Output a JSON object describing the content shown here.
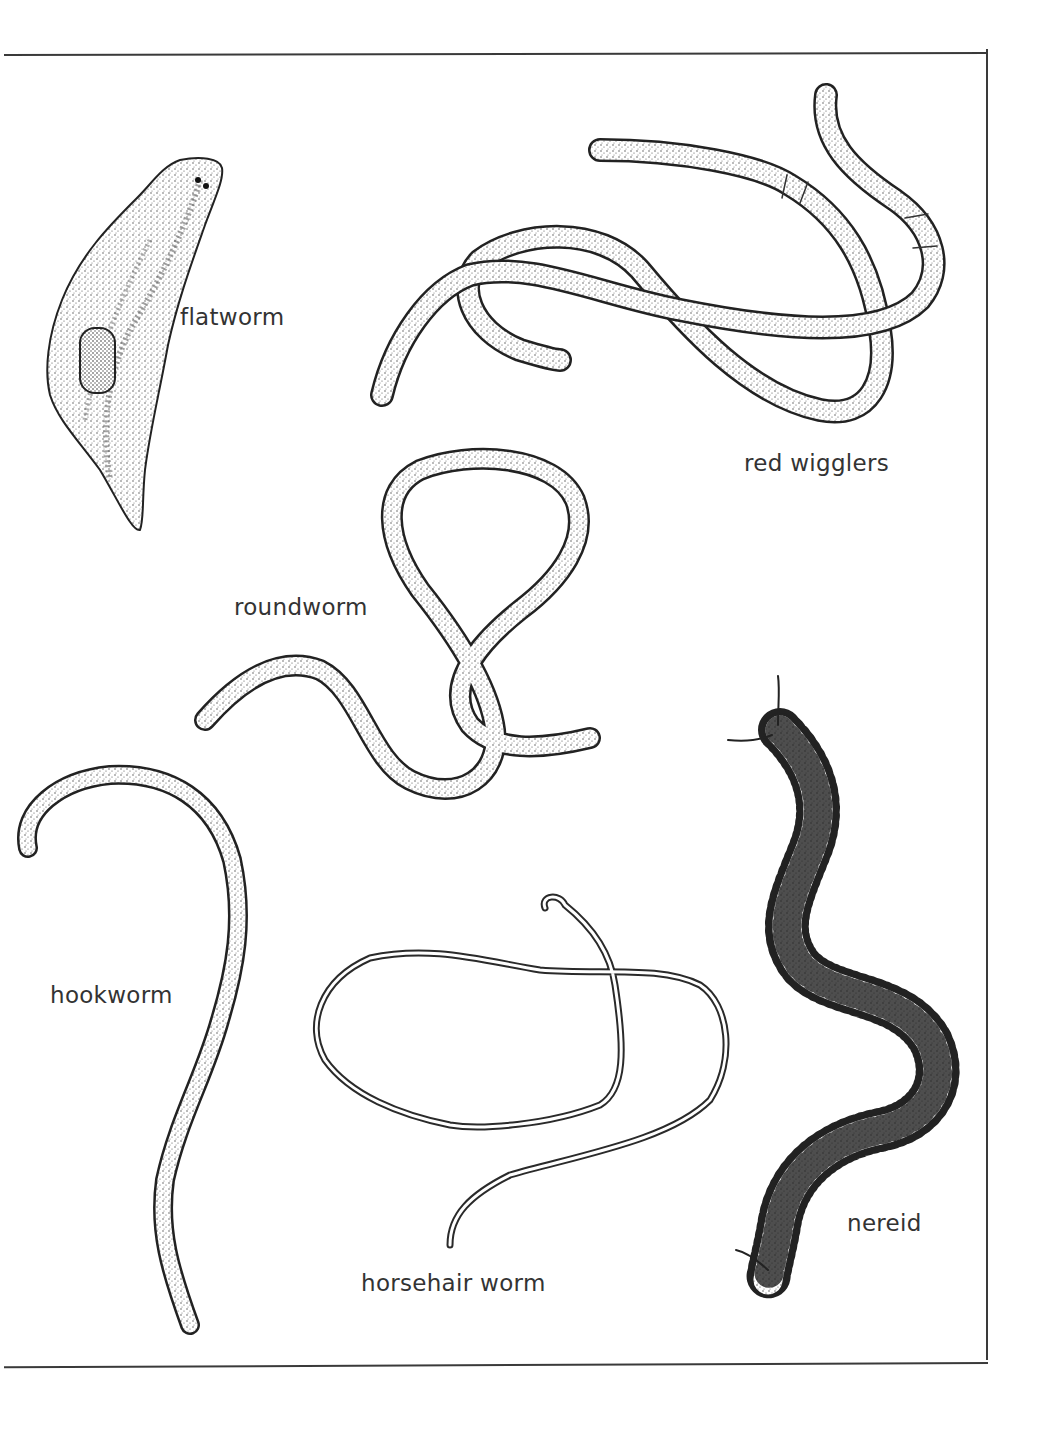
{
  "illustration": {
    "specimens": [
      {
        "id": "flatworm",
        "label": "flatworm"
      },
      {
        "id": "red-wigglers",
        "label": "red wigglers"
      },
      {
        "id": "roundworm",
        "label": "roundworm"
      },
      {
        "id": "hookworm",
        "label": "hookworm"
      },
      {
        "id": "horsehair-worm",
        "label": "horsehair worm"
      },
      {
        "id": "nereid",
        "label": "nereid"
      }
    ]
  },
  "colors": {
    "ink": "#2a2a2a",
    "label": "#333333",
    "paper": "#ffffff"
  }
}
